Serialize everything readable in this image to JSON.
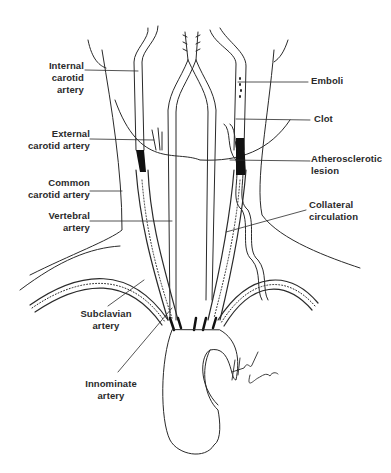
{
  "diagram": {
    "colors": {
      "ink": "#2a2a2a",
      "background": "#ffffff",
      "lesion": "#111111"
    },
    "labels": {
      "internal_carotid": {
        "line1": "Internal",
        "line2": "carotid artery"
      },
      "external_carotid": {
        "line1": "External",
        "line2": "carotid artery"
      },
      "common_carotid": {
        "line1": "Common",
        "line2": "carotid artery"
      },
      "vertebral": {
        "line1": "Vertebral",
        "line2": "artery"
      },
      "emboli": {
        "line1": "Emboli"
      },
      "clot": {
        "line1": "Clot"
      },
      "atherosclerotic": {
        "line1": "Atherosclerotic",
        "line2": "lesion"
      },
      "collateral": {
        "line1": "Collateral",
        "line2": "circulation"
      },
      "subclavian": {
        "line1": "Subclavian",
        "line2": "artery"
      },
      "innominate": {
        "line1": "Innominate",
        "line2": "artery"
      }
    },
    "signature": "Hart Sims"
  }
}
